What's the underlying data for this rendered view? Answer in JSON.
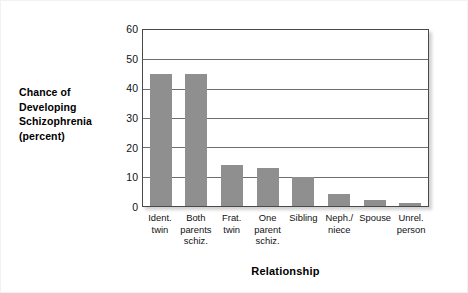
{
  "chart_data": {
    "type": "bar",
    "title": "",
    "xlabel": "Relationship",
    "ylabel": "Chance of Developing Schizophrenia (percent)",
    "ylabel_lines": [
      "Chance of",
      "Developing",
      "Schizophrenia",
      "(percent)"
    ],
    "categories": [
      "Ident. twin",
      "Both parents schiz.",
      "Frat. twin",
      "One parent schiz.",
      "Sibling",
      "Neph./ niece",
      "Spouse",
      "Unrel. person"
    ],
    "category_lines": [
      [
        "Ident.",
        "twin"
      ],
      [
        "Both",
        "parents",
        "schiz."
      ],
      [
        "Frat.",
        "twin"
      ],
      [
        "One",
        "parent",
        "schiz."
      ],
      [
        "Sibling"
      ],
      [
        "Neph./",
        "niece"
      ],
      [
        "Spouse"
      ],
      [
        "Unrel.",
        "person"
      ]
    ],
    "values": [
      45,
      45,
      14,
      13,
      10,
      4,
      2,
      1
    ],
    "ylim": [
      0,
      60
    ],
    "yticks": [
      60,
      50,
      40,
      30,
      20,
      10,
      0
    ],
    "grid": true,
    "legend": "none",
    "bar_color": "#8f8f8f",
    "frame_color": "#4a4a4a",
    "gridline_color": "#6e6e6e"
  }
}
